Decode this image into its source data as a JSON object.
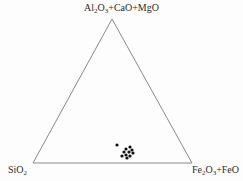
{
  "figure": {
    "type": "ternary-diagram",
    "background_color": "#fdfdfd",
    "line_color": "#8a8a8a",
    "point_color": "#111111"
  },
  "labels": {
    "apex": {
      "full_text": "Al2O3+CaO+MgO",
      "parts": [
        {
          "text": "Al"
        },
        {
          "sub": "2"
        },
        {
          "text": "O"
        },
        {
          "sub": "3"
        },
        {
          "text": "+CaO+MgO"
        }
      ]
    },
    "bottom_left": {
      "full_text": "SiO2",
      "parts": [
        {
          "text": "SiO"
        },
        {
          "sub": "2"
        }
      ]
    },
    "bottom_right": {
      "full_text": "Fe2O3+FeO",
      "parts": [
        {
          "text": "Fe"
        },
        {
          "sub": "2"
        },
        {
          "text": "O"
        },
        {
          "sub": "3"
        },
        {
          "text": "+FeO"
        }
      ]
    }
  },
  "chart_data": {
    "type": "scatter",
    "title": "",
    "xlabel": "",
    "ylabel": "",
    "axes": {
      "apex_label": "Al2O3+CaO+MgO",
      "left_label": "SiO2",
      "right_label": "Fe2O3+FeO",
      "grid": false,
      "legend": false
    },
    "triangle_vertices": {
      "apex": [
        112,
        19
      ],
      "bottom_left": [
        33,
        163
      ],
      "bottom_right": [
        192,
        163
      ]
    },
    "points_pixel": [
      [
        117,
        145
      ],
      [
        126,
        149
      ],
      [
        130,
        147
      ],
      [
        132,
        150
      ],
      [
        124,
        152
      ],
      [
        129,
        152
      ],
      [
        126,
        155
      ],
      [
        130,
        156
      ],
      [
        127,
        158
      ],
      [
        122,
        156
      ],
      [
        133,
        153
      ]
    ],
    "n_points": 11,
    "ternary_fractions": [
      {
        "SiO2": 0.47,
        "Al2O3_CaO_MgO": 0.13,
        "Fe2O3_FeO": 0.4
      },
      {
        "SiO2": 0.42,
        "Al2O3_CaO_MgO": 0.1,
        "Fe2O3_FeO": 0.48
      },
      {
        "SiO2": 0.39,
        "Al2O3_CaO_MgO": 0.11,
        "Fe2O3_FeO": 0.5
      },
      {
        "SiO2": 0.38,
        "Al2O3_CaO_MgO": 0.09,
        "Fe2O3_FeO": 0.53
      },
      {
        "SiO2": 0.44,
        "Al2O3_CaO_MgO": 0.08,
        "Fe2O3_FeO": 0.48
      },
      {
        "SiO2": 0.41,
        "Al2O3_CaO_MgO": 0.08,
        "Fe2O3_FeO": 0.51
      },
      {
        "SiO2": 0.42,
        "Al2O3_CaO_MgO": 0.06,
        "Fe2O3_FeO": 0.52
      },
      {
        "SiO2": 0.39,
        "Al2O3_CaO_MgO": 0.05,
        "Fe2O3_FeO": 0.56
      },
      {
        "SiO2": 0.41,
        "Al2O3_CaO_MgO": 0.03,
        "Fe2O3_FeO": 0.56
      },
      {
        "SiO2": 0.45,
        "Al2O3_CaO_MgO": 0.05,
        "Fe2O3_FeO": 0.5
      },
      {
        "SiO2": 0.37,
        "Al2O3_CaO_MgO": 0.07,
        "Fe2O3_FeO": 0.56
      }
    ],
    "point_radius": 1.6
  }
}
